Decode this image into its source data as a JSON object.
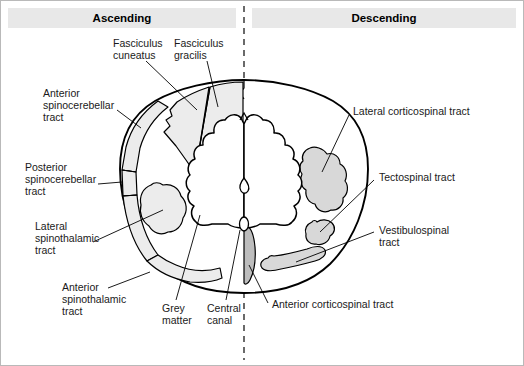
{
  "figure": {
    "background_color": "#ffffff",
    "frame_color": "#b9b9b9",
    "width": 524,
    "height": 366
  },
  "headers": {
    "left": {
      "label": "Ascending",
      "bar_color": "#e8e8e8"
    },
    "right": {
      "label": "Descending",
      "bar_color": "#e8e8e8"
    }
  },
  "midline": {
    "name": "midline-dashed-axis",
    "style": "dashed",
    "color": "#2b2b2b"
  },
  "colors": {
    "tract_fill": "#d8d8d8",
    "tract_fill_light": "#ececec",
    "tract_fill_dark": "#bdbdbd",
    "outline": "#000000",
    "white_matter": "#ffffff"
  },
  "labels": {
    "fasciculus_cuneatus": {
      "lines": [
        "Fasciculus",
        "cuneatus"
      ],
      "side": "ascending"
    },
    "fasciculus_gracilis": {
      "lines": [
        "Fasciculus",
        "gracilis"
      ],
      "side": "ascending"
    },
    "anterior_spinocerebellar": {
      "lines": [
        "Anterior",
        "spinocerebellar",
        "tract"
      ],
      "side": "ascending"
    },
    "posterior_spinocerebellar": {
      "lines": [
        "Posterior",
        "spinocerebellar",
        "tract"
      ],
      "side": "ascending"
    },
    "lateral_spinothalamic": {
      "lines": [
        "Lateral",
        "spinothalamic",
        "tract"
      ],
      "side": "ascending"
    },
    "anterior_spinothalamic": {
      "lines": [
        "Anterior",
        "spinothalamic",
        "tract"
      ],
      "side": "ascending"
    },
    "grey_matter": {
      "lines": [
        "Grey",
        "matter"
      ],
      "side": "center"
    },
    "central_canal": {
      "lines": [
        "Central",
        "canal"
      ],
      "side": "center"
    },
    "lateral_corticospinal": {
      "lines": [
        "Lateral corticospinal tract"
      ],
      "side": "descending"
    },
    "tectospinal": {
      "lines": [
        "Tectospinal tract"
      ],
      "side": "descending"
    },
    "vestibulospinal": {
      "lines": [
        "Vestibulospinal",
        "tract"
      ],
      "side": "descending"
    },
    "anterior_corticospinal": {
      "lines": [
        "Anterior corticospinal tract"
      ],
      "side": "descending"
    }
  }
}
